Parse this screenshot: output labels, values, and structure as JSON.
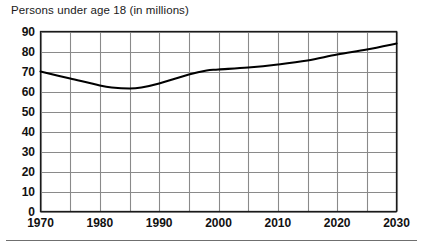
{
  "chart_data": {
    "type": "line",
    "title": "Persons under age 18 (in millions)",
    "xlabel": "",
    "ylabel": "",
    "xlim": [
      1970,
      2030
    ],
    "ylim": [
      0,
      90
    ],
    "ytick_labels": [
      "90",
      "80",
      "70",
      "60",
      "50",
      "40",
      "30",
      "20",
      "10",
      "0"
    ],
    "yticks": [
      90,
      80,
      70,
      60,
      50,
      40,
      30,
      20,
      10,
      0
    ],
    "xtick_labels": [
      "1970",
      "1980",
      "1990",
      "2000",
      "2010",
      "2020",
      "2030"
    ],
    "xticks": [
      1970,
      1980,
      1990,
      2000,
      2010,
      2020,
      2030
    ],
    "x_gridlines": [
      1970,
      1975,
      1980,
      1985,
      1990,
      1995,
      2000,
      2005,
      2010,
      2015,
      2020,
      2025,
      2030
    ],
    "y_gridlines": [
      0,
      10,
      20,
      30,
      40,
      50,
      60,
      70,
      80,
      90
    ],
    "grid": true,
    "legend": "none",
    "series": [
      {
        "name": "Persons under age 18",
        "x": [
          1970,
          1975,
          1980,
          1982,
          1985,
          1987,
          1990,
          1995,
          1998,
          2000,
          2005,
          2010,
          2015,
          2020,
          2025,
          2030
        ],
        "values": [
          70.0,
          66.5,
          63.0,
          62.0,
          61.5,
          62.0,
          64.0,
          68.5,
          70.5,
          71.0,
          72.0,
          73.5,
          75.5,
          78.5,
          81.0,
          84.0
        ]
      }
    ],
    "colors": {
      "line": "#000000",
      "grid": "#8a8a8a",
      "frame": "#1a1a1a",
      "background": "#ffffff",
      "text": "#111111"
    }
  },
  "footer": {
    "rule": ""
  }
}
